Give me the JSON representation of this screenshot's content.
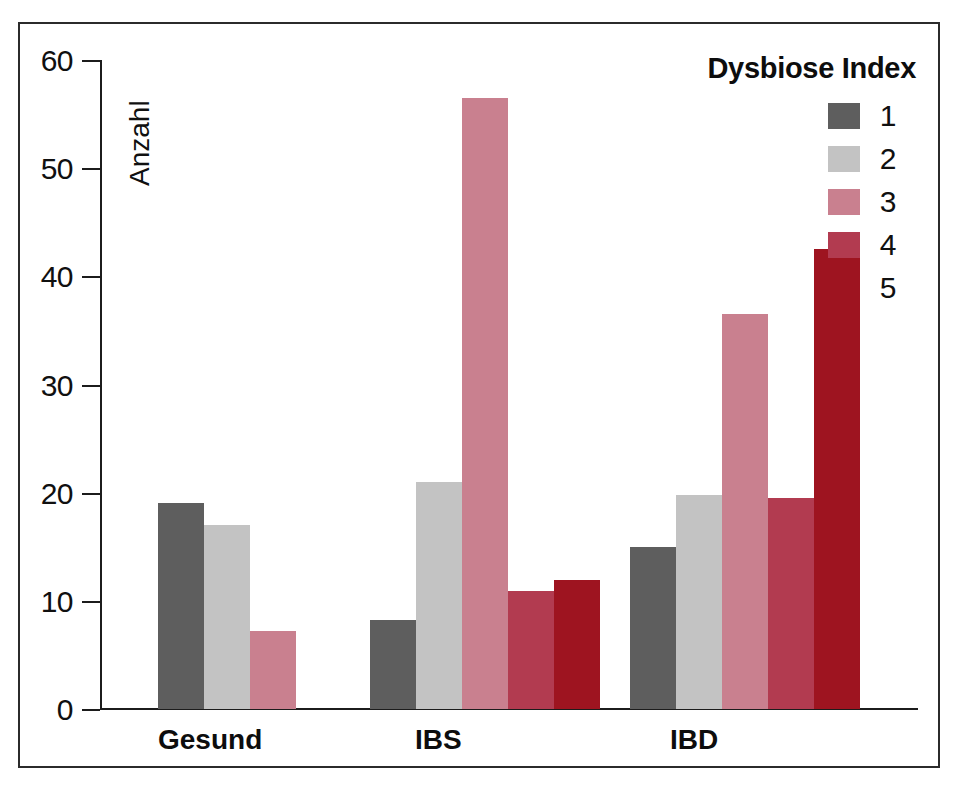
{
  "chart_data": {
    "type": "bar",
    "title": "",
    "xlabel": "",
    "ylabel": "Anzahl",
    "ylim": [
      0,
      60
    ],
    "yticks": [
      0,
      10,
      20,
      30,
      40,
      50,
      60
    ],
    "grid": false,
    "legend_title": "Dysbiose Index",
    "legend_position": "top-right",
    "categories": [
      "Gesund",
      "IBS",
      "IBD"
    ],
    "series": [
      {
        "name": "1",
        "color": "#5e5e5e",
        "values": [
          19,
          8.2,
          15
        ]
      },
      {
        "name": "2",
        "color": "#c3c3c3",
        "values": [
          17,
          21,
          19.8
        ]
      },
      {
        "name": "3",
        "color": "#c9808f",
        "values": [
          7.2,
          56.5,
          36.5
        ]
      },
      {
        "name": "4",
        "color": "#b23b50",
        "values": [
          null,
          10.9,
          19.5
        ]
      },
      {
        "name": "5",
        "color": "#9e1420",
        "values": [
          null,
          11.9,
          42.5
        ]
      }
    ]
  },
  "legend": {
    "title": "Dysbiose Index",
    "items": [
      {
        "label": "1",
        "color": "#5e5e5e"
      },
      {
        "label": "2",
        "color": "#c3c3c3"
      },
      {
        "label": "3",
        "color": "#c9808f"
      },
      {
        "label": "4",
        "color": "#b23b50"
      },
      {
        "label": "5",
        "color": "#9e1420"
      }
    ]
  },
  "axis": {
    "y_title": "Anzahl",
    "y_ticks": [
      "60",
      "50",
      "40",
      "30",
      "20",
      "10",
      "0"
    ],
    "x_labels": [
      "Gesund",
      "IBS",
      "IBD"
    ]
  },
  "caption": {
    "text": ""
  }
}
